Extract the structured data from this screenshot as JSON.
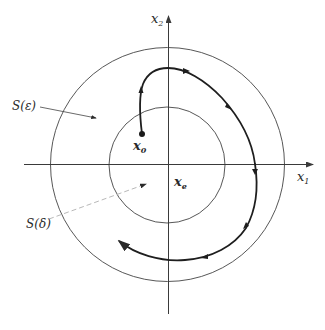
{
  "diagram": {
    "axes": {
      "x_axis": {
        "label": "x",
        "subscript": "1"
      },
      "y_axis": {
        "label": "x",
        "subscript": "2"
      }
    },
    "regions": [
      {
        "id": "outer",
        "label": "S(ε)",
        "description": "outer ball radius epsilon"
      },
      {
        "id": "inner",
        "label": "S(δ)",
        "description": "inner ball radius delta"
      }
    ],
    "points": [
      {
        "id": "initial",
        "label": "x",
        "subscript": "0"
      },
      {
        "id": "equilibrium",
        "label": "x",
        "subscript": "e"
      }
    ],
    "trajectory": {
      "description": "trajectory starting at x0 inside S(δ), remaining within S(ε), spiraling clockwise",
      "direction": "clockwise"
    },
    "colors": {
      "stroke": "#3a3a3a",
      "trajectory": "#1e1e1e",
      "leader_dashed": "#b8b8b8"
    }
  }
}
